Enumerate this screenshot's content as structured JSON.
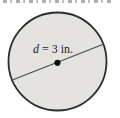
{
  "figure": {
    "type": "circle-with-diameter",
    "label": {
      "variable": "d",
      "rest": " = 3 in."
    },
    "label_full": "d = 3 in.",
    "diameter_value": "3 in.",
    "colors": {
      "background": "#ffffff",
      "circle_fill": "#e4e3e0",
      "circle_stroke": "#2e2e2e",
      "diameter_line": "#4a4a48",
      "center_dot": "#111111",
      "label_text": "#1c1c1c"
    }
  }
}
